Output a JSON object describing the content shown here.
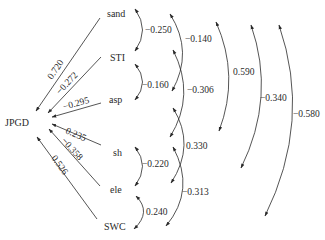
{
  "diagram": {
    "type": "path-analysis",
    "target": {
      "id": "JPGD",
      "label": "JPGD"
    },
    "nodes": [
      {
        "id": "sand",
        "label": "sand"
      },
      {
        "id": "STI",
        "label": "STI"
      },
      {
        "id": "asp",
        "label": "asp"
      },
      {
        "id": "sh",
        "label": "sh"
      },
      {
        "id": "ele",
        "label": "ele"
      },
      {
        "id": "SWC",
        "label": "SWC"
      }
    ],
    "direct_paths": [
      {
        "from": "sand",
        "to": "JPGD",
        "coef": "0.720"
      },
      {
        "from": "STI",
        "to": "JPGD",
        "coef": "−0.272"
      },
      {
        "from": "asp",
        "to": "JPGD",
        "coef": "−0.295"
      },
      {
        "from": "sh",
        "to": "JPGD",
        "coef": "0.235"
      },
      {
        "from": "ele",
        "to": "JPGD",
        "coef": "−0.358"
      },
      {
        "from": "SWC",
        "to": "JPGD",
        "coef": "0.526"
      }
    ],
    "correlations": [
      {
        "a": "sand",
        "b": "STI",
        "coef": "−0.250"
      },
      {
        "a": "STI",
        "b": "asp",
        "coef": "−0.160"
      },
      {
        "a": "sand",
        "b": "asp",
        "coef": "−0.140"
      },
      {
        "a": "STI",
        "b": "sh",
        "coef": "−0.306"
      },
      {
        "a": "asp",
        "b": "ele",
        "coef": "0.330"
      },
      {
        "a": "sh",
        "b": "ele",
        "coef": "−0.220"
      },
      {
        "a": "sh",
        "b": "SWC",
        "coef": "−0.313"
      },
      {
        "a": "ele",
        "b": "SWC",
        "coef": "0.240"
      },
      {
        "a": "sand",
        "b": "sh",
        "coef": "0.590"
      },
      {
        "a": "sand",
        "b": "ele",
        "coef": "−0.340"
      },
      {
        "a": "sand",
        "b": "SWC",
        "coef": "−0.580"
      }
    ]
  }
}
